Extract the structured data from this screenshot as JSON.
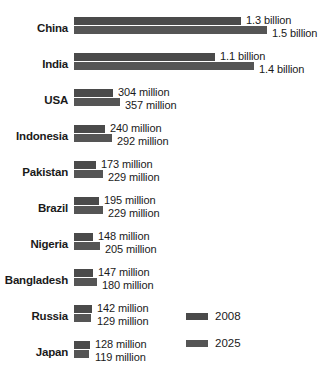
{
  "chart_data": {
    "type": "bar",
    "orientation": "horizontal",
    "title": "",
    "subtitle": "",
    "xlabel": "",
    "ylabel": "",
    "grid": false,
    "legend_position": "bottom-right",
    "axis_visible": false,
    "unit": "people",
    "bar_color": "#4d4d4d",
    "background_color": "#ffffff",
    "text_color": "#1a1a1a",
    "categories": [
      "China",
      "India",
      "USA",
      "Indonesia",
      "Pakistan",
      "Brazil",
      "Nigeria",
      "Bangladesh",
      "Russia",
      "Japan"
    ],
    "series": [
      {
        "name": "2008",
        "color": "#4a4a4a",
        "values": [
          1300,
          1100,
          304,
          240,
          173,
          195,
          148,
          147,
          142,
          128
        ],
        "labels": [
          "1.3 billion",
          "1.1 billion",
          "304 million",
          "240 million",
          "173 million",
          "195 million",
          "148 million",
          "147 million",
          "142 million",
          "128 million"
        ]
      },
      {
        "name": "2025",
        "color": "#555555",
        "values": [
          1500,
          1400,
          357,
          292,
          229,
          229,
          205,
          180,
          129,
          119
        ],
        "labels": [
          "1.5 billion",
          "1.4 billion",
          "357 million",
          "292 million",
          "229 million",
          "229 million",
          "205 million",
          "180 million",
          "129 million",
          "119 million"
        ]
      }
    ],
    "xlim": [
      0,
      1500
    ],
    "value_unit_note": "values expressed in millions of people"
  },
  "legend": {
    "items": [
      {
        "label": "2008"
      },
      {
        "label": "2025"
      }
    ]
  },
  "rows": [
    {
      "category": "China",
      "label_2008": "1.3 billion",
      "label_2025": "1.5 billion"
    },
    {
      "category": "India",
      "label_2008": "1.1 billion",
      "label_2025": "1.4 billion"
    },
    {
      "category": "USA",
      "label_2008": "304 million",
      "label_2025": "357 million"
    },
    {
      "category": "Indonesia",
      "label_2008": "240 million",
      "label_2025": "292 million"
    },
    {
      "category": "Pakistan",
      "label_2008": "173 million",
      "label_2025": "229 million"
    },
    {
      "category": "Brazil",
      "label_2008": "195 million",
      "label_2025": "229 million"
    },
    {
      "category": "Nigeria",
      "label_2008": "148 million",
      "label_2025": "205 million"
    },
    {
      "category": "Bangladesh",
      "label_2008": "147 million",
      "label_2025": "180 million"
    },
    {
      "category": "Russia",
      "label_2008": "142 million",
      "label_2025": "129 million"
    },
    {
      "category": "Japan",
      "label_2008": "128 million",
      "label_2025": "119 million"
    }
  ]
}
